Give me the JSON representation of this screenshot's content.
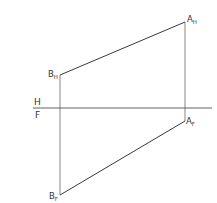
{
  "diagram": {
    "type": "orthographic-projection",
    "stroke_color": "#2a2a2a",
    "fold_line": {
      "label_above": "H",
      "label_below": "F",
      "y": 108,
      "x1": 33,
      "x2": 212
    },
    "points": {
      "A_H": {
        "label": "A",
        "sub": "H",
        "x": 185,
        "y": 22
      },
      "B_H": {
        "label": "B",
        "sub": "H",
        "x": 60,
        "y": 75
      },
      "A_F": {
        "label": "A",
        "sub": "F",
        "x": 185,
        "y": 121
      },
      "B_F": {
        "label": "B",
        "sub": "F",
        "x": 60,
        "y": 195
      }
    },
    "segments": [
      {
        "from": "B_H",
        "to": "A_H",
        "name": "line-ab-horizontal-view"
      },
      {
        "from": "B_F",
        "to": "A_F",
        "name": "line-ab-frontal-view"
      },
      {
        "from": "B_H",
        "to": "B_F",
        "name": "projector-b"
      },
      {
        "from": "A_H",
        "to": "A_F",
        "name": "projector-a"
      }
    ]
  }
}
